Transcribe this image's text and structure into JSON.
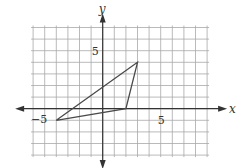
{
  "diagram": {
    "type": "coordinate-plane",
    "x_axis": {
      "label": "x",
      "tick_label": "5",
      "neg_tick_label": "−5",
      "range": [
        -6,
        9
      ]
    },
    "y_axis": {
      "label": "y",
      "tick_label": "5",
      "range": [
        -4,
        7
      ]
    },
    "grid": {
      "step": 1,
      "color": "#9a9a9a"
    },
    "triangle": {
      "vertices": [
        [
          3,
          4
        ],
        [
          2,
          0
        ],
        [
          -4,
          -1
        ]
      ],
      "stroke": "#4a4a4a"
    },
    "origin_px": [
      102.7,
      108.7
    ],
    "unit_px": 11.6
  }
}
